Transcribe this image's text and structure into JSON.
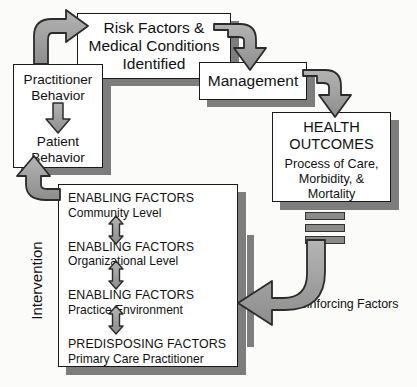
{
  "diagram": {
    "background_color": "#fbfbfa",
    "ink_color": "#111111",
    "arrow_fill": "#9a9a9a",
    "arrow_stroke": "#2b2b2b",
    "shadow_color": "#7d7d7d"
  },
  "boxes": {
    "risk_factors": {
      "line1": "Risk Factors &",
      "line2": "Medical Conditions",
      "line3": "Identified"
    },
    "management": {
      "label": "Management"
    },
    "behavior": {
      "line1": "Practitioner",
      "line2": "Behavior",
      "line3": "Patient",
      "line4": "Behavior"
    },
    "health_outcomes": {
      "heading1": "HEALTH",
      "heading2": "OUTCOMES",
      "sub1": "Process of Care,",
      "sub2": "Morbidity, &",
      "sub3": "Mortality"
    },
    "enabling": {
      "groups": [
        {
          "title": "ENABLING FACTORS",
          "detail": "Community Level"
        },
        {
          "title": "ENABLING FACTORS",
          "detail": "Organizational Level"
        },
        {
          "title": "ENABLING FACTORS",
          "detail": "Practice Environment"
        },
        {
          "title": "PREDISPOSING FACTORS",
          "detail": "Primary Care Practitioner"
        }
      ]
    }
  },
  "labels": {
    "intervention": "Intervention",
    "reinforcing_factors": "Reinforcing Factors"
  },
  "connectors": [
    {
      "name": "behavior-to-risk-factors",
      "icon": "curved-arrow-up-right"
    },
    {
      "name": "risk-factors-to-management",
      "icon": "curved-arrow-down-right"
    },
    {
      "name": "management-to-health-outcomes",
      "icon": "curved-arrow-down-right"
    },
    {
      "name": "enabling-to-behavior",
      "icon": "curved-arrow-up"
    },
    {
      "name": "health-outcomes-to-enabling",
      "icon": "curved-arrow-left"
    },
    {
      "name": "practitioner-to-patient",
      "icon": "arrow-down"
    },
    {
      "name": "enabling-level-link",
      "icon": "double-headed-arrow-vertical"
    }
  ]
}
